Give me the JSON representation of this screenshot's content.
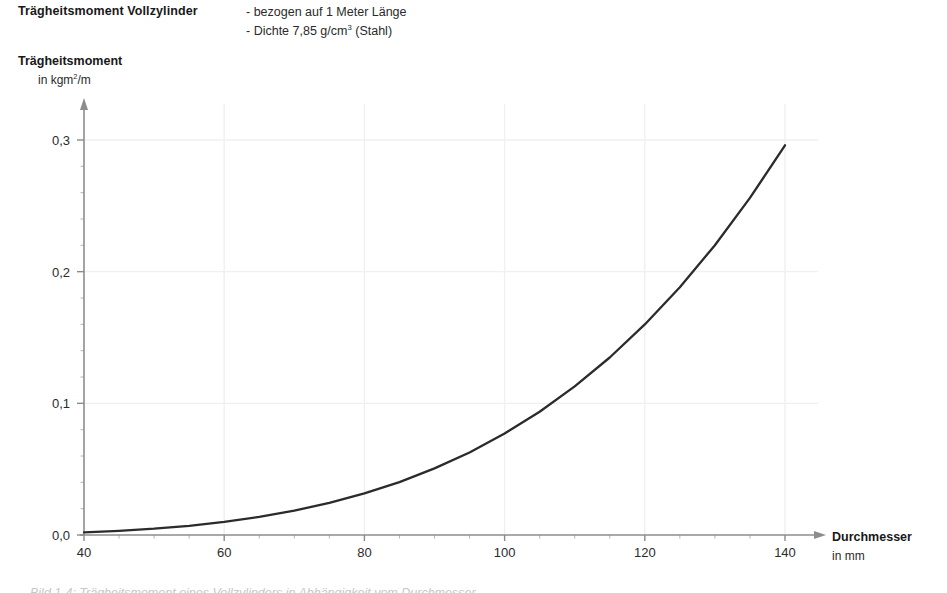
{
  "header": {
    "title": "Trägheitsmoment Vollzylinder",
    "notes": [
      "- bezogen auf 1 Meter Länge",
      "- Dichte 7,85 g/cm",
      "3",
      " (Stahl)"
    ],
    "note_line1": "- bezogen auf 1 Meter Länge",
    "note_line2_pre": "- Dichte 7,85 g/cm",
    "note_line2_sup": "3",
    "note_line2_post": " (Stahl)"
  },
  "axes": {
    "y_title": "Trägheitsmoment",
    "y_unit_pre": "in kgm",
    "y_unit_sup": "2",
    "y_unit_post": "/m",
    "x_title": "Durchmesser",
    "x_unit": "in mm"
  },
  "ticks": {
    "y": [
      "0,3",
      "0,2",
      "0,1",
      "0,0"
    ],
    "x": [
      "40",
      "60",
      "80",
      "100",
      "120",
      "140"
    ]
  },
  "colors": {
    "curve": "#2b2b2b",
    "axis": "#8a8a8a",
    "grid": "#f0f0f0",
    "text": "#1a1a1a"
  },
  "bottom_caption": "Bild 1-4:  Trägheitsmoment eines Vollzylinders in Abhängigkeit vom Durchmesser",
  "chart_data": {
    "type": "line",
    "title": "Trägheitsmoment Vollzylinder",
    "subtitle": "- bezogen auf 1 Meter Länge / - Dichte 7,85 g/cm3 (Stahl)",
    "xlabel": "Durchmesser in mm",
    "ylabel": "Trägheitsmoment in kgm2/m",
    "xlim": [
      40,
      140
    ],
    "ylim": [
      0.0,
      0.32
    ],
    "xticks": [
      40,
      60,
      80,
      100,
      120,
      140
    ],
    "yticks": [
      0.0,
      0.1,
      0.2,
      0.3
    ],
    "ytick_labels": [
      "0,0",
      "0,1",
      "0,2",
      "0,3"
    ],
    "grid": true,
    "legend": "none",
    "series": [
      {
        "name": "Trägheitsmoment Vollzylinder (Stahl, 1 m)",
        "formula": "J = pi * rho * d^4 / 32",
        "x": [
          40,
          45,
          50,
          55,
          60,
          65,
          70,
          75,
          80,
          85,
          90,
          95,
          100,
          105,
          110,
          115,
          120,
          125,
          130,
          135,
          140
        ],
        "y": [
          0.002,
          0.0032,
          0.0048,
          0.007,
          0.01,
          0.0138,
          0.0185,
          0.0244,
          0.0316,
          0.0402,
          0.0506,
          0.0627,
          0.0771,
          0.0936,
          0.1129,
          0.1348,
          0.1599,
          0.1882,
          0.2201,
          0.256,
          0.296
        ]
      }
    ]
  }
}
